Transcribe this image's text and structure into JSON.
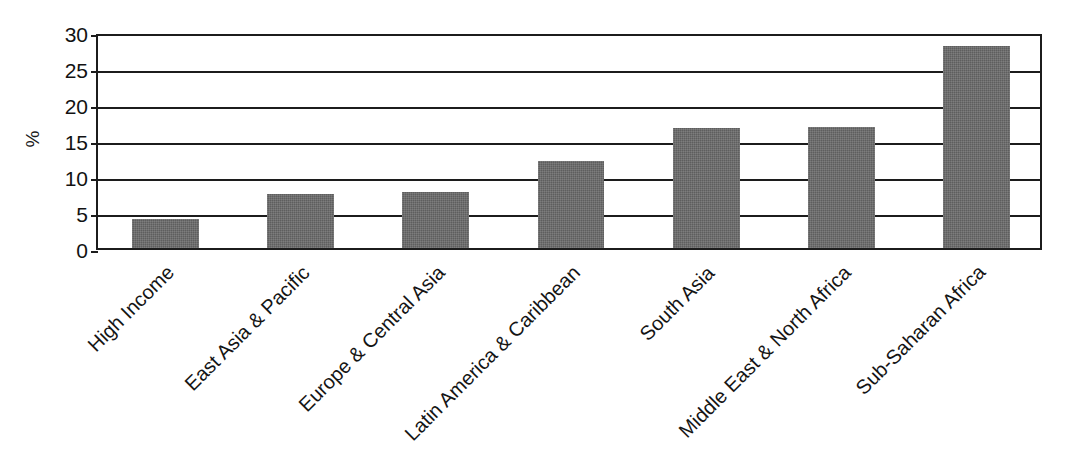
{
  "chart_data": {
    "type": "bar",
    "title": "",
    "xlabel": "",
    "ylabel": "%",
    "ylim": [
      0,
      30
    ],
    "yticks": [
      0,
      5,
      10,
      15,
      20,
      25,
      30
    ],
    "ytick_labels": [
      "0",
      "5",
      "10",
      "15",
      "20",
      "25",
      "30"
    ],
    "grid": true,
    "legend": null,
    "bar_color": "#5e5e5e",
    "axis_color": "#1c1c1c",
    "categories": [
      "High Income",
      "East Asia & Pacific",
      "Europe & Central Asia",
      "Latin America & Caribbean",
      "South Asia",
      "Middle East & North Africa",
      "Sub-Saharan Africa"
    ],
    "values": [
      4.0,
      7.5,
      7.8,
      12.1,
      16.6,
      16.8,
      28.0
    ]
  }
}
